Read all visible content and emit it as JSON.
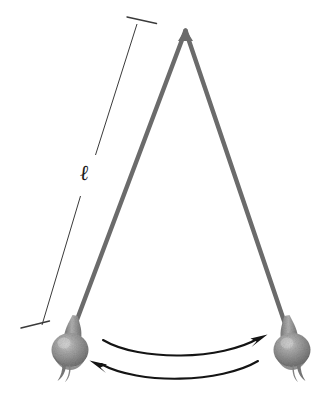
{
  "figure": {
    "type": "diagram",
    "caption": "Simple pendulum swinging between two extreme positions",
    "background_color": "#ffffff",
    "width": 329,
    "height": 410
  },
  "labels": {
    "length_symbol": "ℓ",
    "length_symbol_name": "script-ell",
    "length_description": "length of pendulum string"
  },
  "pivot": {
    "name": "pivot-point",
    "x": 185,
    "y": 30
  },
  "strings": [
    {
      "name": "string-left",
      "from_x": 185,
      "from_y": 30,
      "to_x": 70,
      "to_y": 336,
      "color": "#6b6b6b",
      "width": 4.4
    },
    {
      "name": "string-right",
      "from_x": 185,
      "from_y": 30,
      "to_x": 289,
      "to_y": 336,
      "color": "#6b6b6b",
      "width": 4.4
    }
  ],
  "bobs": [
    {
      "name": "pendulum-bob-left",
      "position": "left-extreme",
      "cx": 70,
      "cy": 350,
      "rx": 18,
      "ry": 17,
      "color": "#8d8d8d"
    },
    {
      "name": "pendulum-bob-right",
      "position": "right-extreme",
      "cx": 292,
      "cy": 350,
      "rx": 18,
      "ry": 17,
      "color": "#8d8d8d"
    }
  ],
  "dimension_line": {
    "name": "length-dimension-line",
    "color": "#3a3a3a",
    "width": 1,
    "top_x": 137,
    "top_y": 24,
    "bottom_x": 42,
    "bottom_y": 325,
    "tick_top": {
      "x1": 127,
      "y1": 17,
      "x2": 156,
      "y2": 23
    },
    "tick_bottom": {
      "x1": 21,
      "y1": 328,
      "x2": 49,
      "y2": 321
    },
    "label_position": {
      "x": 80,
      "y": 163
    }
  },
  "arrows": [
    {
      "name": "swing-arrow-rightward",
      "direction": "right",
      "color": "#141414",
      "start_x": 103,
      "start_y": 341,
      "end_x": 266,
      "end_y": 339,
      "sag": 16
    },
    {
      "name": "swing-arrow-leftward",
      "direction": "left",
      "color": "#141414",
      "start_x": 258,
      "start_y": 362,
      "end_x": 92,
      "end_y": 366,
      "sag": 16
    }
  ]
}
